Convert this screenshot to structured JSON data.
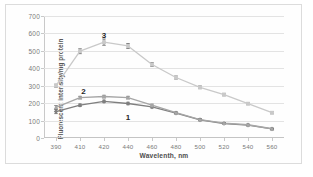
{
  "chart_data": {
    "type": "line",
    "title": "",
    "xlabel": "Wavelenth, nm",
    "ylabel": "Fluorescent intensity/mg protein",
    "x": [
      390,
      410,
      420,
      440,
      460,
      480,
      500,
      520,
      540,
      560
    ],
    "xtick_labels": [
      "390",
      "410",
      "420",
      "440",
      "460",
      "480",
      "500",
      "520",
      "540",
      "560"
    ],
    "ytick_labels": [
      "0",
      "100",
      "200",
      "300",
      "400",
      "500",
      "600",
      "700"
    ],
    "yticks": [
      0,
      100,
      200,
      300,
      400,
      500,
      600,
      700
    ],
    "xlim": [
      390,
      560
    ],
    "ylim": [
      0,
      700
    ],
    "grid": true,
    "legend": "none",
    "annotations": [
      {
        "text": "1",
        "x": 440,
        "y": 120
      },
      {
        "text": "2",
        "x": 418,
        "y": 268
      },
      {
        "text": "3",
        "x": 420,
        "y": 592
      }
    ],
    "series": [
      {
        "name": "1",
        "color": "#7f7f7f",
        "marker": "diamond",
        "values": [
          152,
          188,
          210,
          198,
          178,
          143,
          104,
          83,
          74,
          52
        ],
        "errors": [
          12,
          7,
          7,
          7,
          6,
          5,
          5,
          4,
          4,
          4
        ]
      },
      {
        "name": "2",
        "color": "#a6a6a6",
        "marker": "triangle",
        "values": [
          176,
          232,
          238,
          232,
          188,
          145,
          106,
          85,
          76,
          53
        ],
        "errors": [
          10,
          7,
          7,
          7,
          6,
          5,
          5,
          4,
          4,
          4
        ]
      },
      {
        "name": "3",
        "color": "#c9c9c9",
        "marker": "square",
        "values": [
          300,
          498,
          550,
          528,
          422,
          347,
          291,
          249,
          197,
          145
        ],
        "errors": [
          9,
          14,
          18,
          14,
          11,
          9,
          8,
          7,
          6,
          6
        ]
      }
    ]
  }
}
